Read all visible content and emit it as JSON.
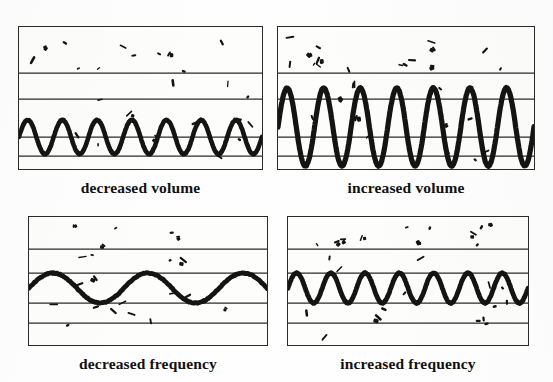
{
  "figure": {
    "title_visible": false,
    "background_color": "#fefefe",
    "ink_color": "#141412",
    "rule_color": "#2a2a28"
  },
  "panels": [
    {
      "id": "decreased-volume",
      "caption": "decreased volume",
      "position": "top-left",
      "box": {
        "x": 18,
        "y": 26,
        "width": 243,
        "height": 142
      },
      "band_lines_y": [
        46,
        72,
        110,
        129
      ],
      "wave": {
        "cycles": 7,
        "amplitude_px": 17,
        "stroke_px": 4.6,
        "center_y": 110,
        "start_phase": "rising",
        "shape": "rounded-sine"
      },
      "speckle_count": 29
    },
    {
      "id": "increased-volume",
      "caption": "increased volume",
      "position": "top-right",
      "box": {
        "x": 277,
        "y": 26,
        "width": 256,
        "height": 142
      },
      "band_lines_y": [
        46,
        72,
        110,
        129
      ],
      "wave": {
        "cycles": 7,
        "amplitude_px": 39,
        "stroke_px": 5.2,
        "center_y": 100,
        "start_phase": "rising",
        "shape": "rounded-sine"
      },
      "speckle_count": 31
    },
    {
      "id": "decreased-frequency",
      "caption": "decreased frequency",
      "position": "bottom-left",
      "box": {
        "x": 28,
        "y": 216,
        "width": 238,
        "height": 128
      },
      "band_lines_y": [
        32,
        56,
        86,
        106
      ],
      "wave": {
        "cycles": 2.5,
        "amplitude_px": 15,
        "stroke_px": 4.8,
        "center_y": 71,
        "start_phase": "rising",
        "shape": "rounded-sine"
      },
      "speckle_count": 24
    },
    {
      "id": "increased-frequency",
      "caption": "increased frequency",
      "position": "bottom-right",
      "box": {
        "x": 287,
        "y": 216,
        "width": 240,
        "height": 128
      },
      "band_lines_y": [
        32,
        56,
        86,
        106
      ],
      "wave": {
        "cycles": 7,
        "amplitude_px": 15,
        "stroke_px": 4.8,
        "center_y": 71,
        "start_phase": "rising",
        "shape": "rounded-sine"
      },
      "speckle_count": 27
    }
  ],
  "chart_data": {
    "type": "line",
    "xlabel": "",
    "ylabel": "",
    "grid": true,
    "legend_position": "none",
    "series": [
      {
        "name": "decreased volume",
        "cycles": 7,
        "relative_amplitude": 0.44,
        "panel": "top-left"
      },
      {
        "name": "increased volume",
        "cycles": 7,
        "relative_amplitude": 1.0,
        "panel": "top-right"
      },
      {
        "name": "decreased frequency",
        "cycles": 2.5,
        "relative_amplitude": 0.38,
        "panel": "bottom-left"
      },
      {
        "name": "increased frequency",
        "cycles": 7,
        "relative_amplitude": 0.38,
        "panel": "bottom-right"
      }
    ]
  }
}
